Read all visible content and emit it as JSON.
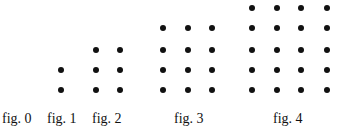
{
  "figure": {
    "type": "dot-pattern-sequence",
    "dot_color": "#111111",
    "background": "#ffffff",
    "panels": [
      {
        "label": "fig. 0",
        "label_x": 2,
        "columns": 0,
        "rows": 0,
        "dot_count": 0,
        "col_x": [],
        "row_y": []
      },
      {
        "label": "fig. 1",
        "label_x": 47,
        "columns": 1,
        "rows": 2,
        "dot_count": 2,
        "col_x": [
          61
        ],
        "row_y": [
          70,
          90
        ]
      },
      {
        "label": "fig. 2",
        "label_x": 92,
        "columns": 2,
        "rows": 3,
        "dot_count": 6,
        "col_x": [
          96,
          120
        ],
        "row_y": [
          50,
          70,
          90
        ]
      },
      {
        "label": "fig. 3",
        "label_x": 174,
        "columns": 3,
        "rows": 4,
        "dot_count": 12,
        "col_x": [
          163,
          188,
          212
        ],
        "row_y": [
          28,
          50,
          70,
          90
        ]
      },
      {
        "label": "fig. 4",
        "label_x": 273,
        "columns": 4,
        "rows": 5,
        "dot_count": 20,
        "col_x": [
          252,
          277,
          301,
          327
        ],
        "row_y": [
          8,
          28,
          50,
          70,
          90
        ]
      }
    ],
    "label_y": 111
  }
}
